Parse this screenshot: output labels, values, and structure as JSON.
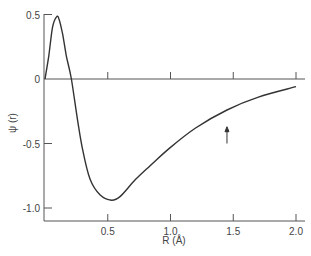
{
  "chart_data": {
    "type": "line",
    "title": "",
    "xlabel": "R (Å)",
    "ylabel": "ψ (r)",
    "xlim": [
      0,
      2.05
    ],
    "ylim": [
      -1.1,
      0.5
    ],
    "grid": false,
    "x_ticks": [
      0.5,
      1.0,
      1.5,
      2.0
    ],
    "x_tick_labels": [
      "0.5",
      "1.0",
      "1.5",
      "2.0"
    ],
    "y_ticks": [
      0.5,
      0,
      -0.5,
      -1.0
    ],
    "y_tick_labels": [
      "0.5",
      "0",
      "-0.5",
      "-1.0"
    ],
    "series": [
      {
        "name": "ψ(r)",
        "x": [
          0.0,
          0.03,
          0.06,
          0.09,
          0.11,
          0.14,
          0.17,
          0.21,
          0.26,
          0.3,
          0.36,
          0.44,
          0.53,
          0.6,
          0.72,
          0.84,
          1.0,
          1.2,
          1.45,
          1.7,
          2.0
        ],
        "y": [
          0.0,
          0.18,
          0.4,
          0.48,
          0.47,
          0.35,
          0.18,
          0.0,
          -0.32,
          -0.55,
          -0.78,
          -0.9,
          -0.94,
          -0.91,
          -0.78,
          -0.67,
          -0.53,
          -0.38,
          -0.24,
          -0.14,
          -0.06
        ]
      }
    ],
    "annotations": [
      {
        "type": "arrow",
        "x": 1.45,
        "y_from": -0.5,
        "y_to": -0.37,
        "direction": "up"
      }
    ]
  }
}
